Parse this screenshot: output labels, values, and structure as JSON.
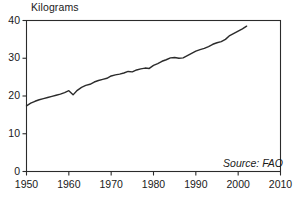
{
  "chart_data": {
    "type": "line",
    "title": "",
    "ylabel": "Kilograms",
    "xlabel": "",
    "source": "Source: FAO",
    "xlim": [
      1950,
      2010
    ],
    "ylim": [
      0,
      40
    ],
    "xticks": [
      1950,
      1960,
      1970,
      1980,
      1990,
      2000,
      2010
    ],
    "yticks": [
      0,
      10,
      20,
      30,
      40
    ],
    "grid": false,
    "legend": "none",
    "series": [
      {
        "name": "Kilograms per person",
        "x": [
          1950,
          1951,
          1952,
          1953,
          1954,
          1955,
          1956,
          1957,
          1958,
          1959,
          1960,
          1961,
          1962,
          1963,
          1964,
          1965,
          1966,
          1967,
          1968,
          1969,
          1970,
          1971,
          1972,
          1973,
          1974,
          1975,
          1976,
          1977,
          1978,
          1979,
          1980,
          1981,
          1982,
          1983,
          1984,
          1985,
          1986,
          1987,
          1988,
          1989,
          1990,
          1991,
          1992,
          1993,
          1994,
          1995,
          1996,
          1997,
          1998,
          1999,
          2000,
          2001,
          2002
        ],
        "values": [
          17.4,
          18.1,
          18.6,
          19.0,
          19.3,
          19.6,
          19.9,
          20.2,
          20.5,
          20.9,
          21.4,
          20.3,
          21.5,
          22.3,
          22.8,
          23.1,
          23.7,
          24.1,
          24.4,
          24.7,
          25.3,
          25.6,
          25.8,
          26.1,
          26.5,
          26.4,
          26.9,
          27.2,
          27.4,
          27.3,
          28.1,
          28.6,
          29.2,
          29.6,
          30.1,
          30.2,
          30.0,
          30.1,
          30.7,
          31.3,
          31.9,
          32.3,
          32.6,
          33.1,
          33.7,
          34.1,
          34.4,
          35.0,
          36.0,
          36.6,
          37.2,
          37.8,
          38.5
        ]
      }
    ]
  },
  "ytick_labels": [
    "40",
    "30",
    "20",
    "10",
    "0"
  ],
  "xtick_labels": [
    "1950",
    "1960",
    "1970",
    "1980",
    "1990",
    "2000",
    "2010"
  ]
}
